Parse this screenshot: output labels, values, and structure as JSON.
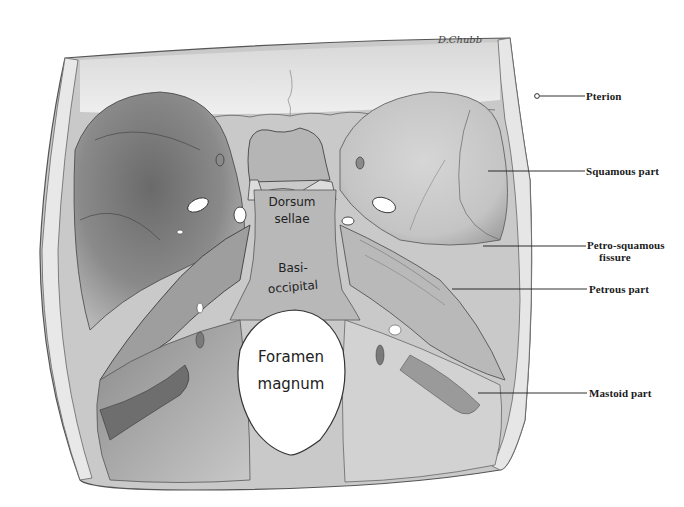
{
  "figure": {
    "signature": "D.Chubb",
    "colors": {
      "background": "#ffffff",
      "bone_light": "#e4e4e4",
      "bone_mid": "#a8a8a8",
      "bone_dark": "#5a5a5a",
      "ink": "#1a1a1a"
    }
  },
  "inner_labels": [
    {
      "id": "dorsum-sellae",
      "lines": [
        "Dorsum",
        "sellae"
      ]
    },
    {
      "id": "basi-occipital",
      "lines": [
        "Basi-",
        "occipital"
      ]
    },
    {
      "id": "foramen-magnum",
      "lines": [
        "Foramen",
        "magnum"
      ]
    }
  ],
  "callouts": [
    {
      "id": "pterion",
      "label": "Pterion",
      "line2": ""
    },
    {
      "id": "squamous-part",
      "label": "Squamous part",
      "line2": ""
    },
    {
      "id": "petro-squamous-fissure",
      "label": "Petro-squamous",
      "line2": "fissure"
    },
    {
      "id": "petrous-part",
      "label": "Petrous part",
      "line2": ""
    },
    {
      "id": "mastoid-part",
      "label": "Mastoid part",
      "line2": ""
    }
  ]
}
